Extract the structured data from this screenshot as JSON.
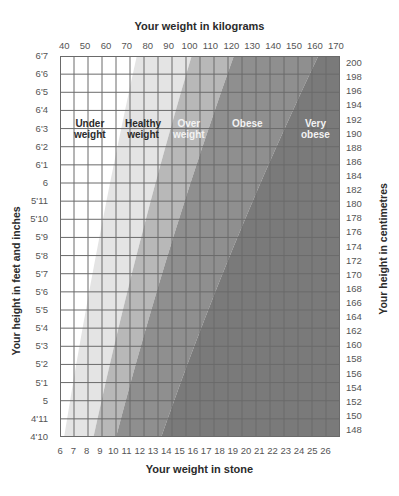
{
  "chart_data": {
    "type": "area",
    "xlabel_top": "Your weight in kilograms",
    "xlabel_bottom": "Your weight in stone",
    "ylabel_left": "Your height in feet and inches",
    "ylabel_right": "Your height in centimetres",
    "x_ticks_kg": [
      "40",
      "50",
      "60",
      "70",
      "80",
      "90",
      "100",
      "110",
      "120",
      "130",
      "140",
      "150",
      "160",
      "170"
    ],
    "x_ticks_stone": [
      "6",
      "7",
      "8",
      "9",
      "10",
      "11",
      "12",
      "13",
      "14",
      "15",
      "16",
      "17",
      "18",
      "19",
      "20",
      "21",
      "22",
      "23",
      "24",
      "25",
      "26"
    ],
    "y_ticks_feet": [
      "6'7",
      "6'6",
      "6'5",
      "6'4",
      "6'3",
      "6'2",
      "6'1",
      "6",
      "5'11",
      "5'10",
      "5'9",
      "5'8",
      "5'7",
      "5'6",
      "5'5",
      "5'4",
      "5'3",
      "5'2",
      "5'1",
      "5",
      "4'11",
      "4'10"
    ],
    "y_ticks_cm": [
      "200",
      "198",
      "196",
      "194",
      "192",
      "190",
      "188",
      "186",
      "184",
      "182",
      "180",
      "178",
      "176",
      "174",
      "172",
      "170",
      "168",
      "166",
      "164",
      "162",
      "160",
      "158",
      "156",
      "154",
      "152",
      "150",
      "148"
    ],
    "xlim_kg": [
      38,
      172
    ],
    "ylim_cm": [
      147,
      201
    ],
    "grid": true,
    "bands": [
      {
        "name": "Under weight",
        "label_line1": "Under",
        "label_line2": "weight",
        "color": "#ffffff",
        "text_color": "#2b2b2b"
      },
      {
        "name": "Healthy weight",
        "label_line1": "Healthy",
        "label_line2": "weight",
        "color": "#e4e4e4",
        "text_color": "#2b2b2b"
      },
      {
        "name": "Over weight",
        "label_line1": "Over",
        "label_line2": "weight",
        "color": "#b8b8b8",
        "text_color": "#f2f2f2"
      },
      {
        "name": "Obese",
        "label_line1": "Obese",
        "label_line2": "",
        "color": "#8f8f8f",
        "text_color": "#f2f2f2"
      },
      {
        "name": "Very obese",
        "label_line1": "Very",
        "label_line2": "obese",
        "color": "#7a7a7a",
        "text_color": "#f2f2f2"
      }
    ],
    "band_boundaries_bmi": [
      18.5,
      25,
      30,
      40
    ]
  }
}
